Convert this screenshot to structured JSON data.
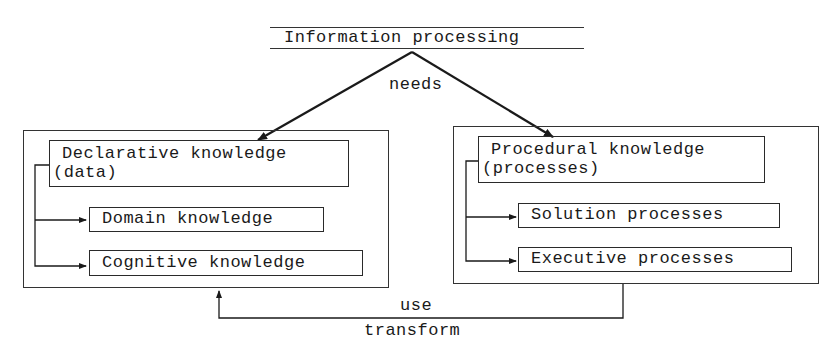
{
  "diagram": {
    "root": {
      "label": "Information processing"
    },
    "edge_root": {
      "label": "needs"
    },
    "left": {
      "title_line1": "Declarative knowledge",
      "title_line2": "(data)",
      "children": [
        {
          "label": "Domain knowledge"
        },
        {
          "label": "Cognitive knowledge"
        }
      ]
    },
    "right": {
      "title_line1": "Procedural knowledge",
      "title_line2": "(processes)",
      "children": [
        {
          "label": "Solution processes"
        },
        {
          "label": "Executive processes"
        }
      ]
    },
    "feedback": {
      "label_top": "use",
      "label_bottom": "transform"
    },
    "colors": {
      "ink": "#1a1a1a",
      "background": "#ffffff"
    }
  }
}
